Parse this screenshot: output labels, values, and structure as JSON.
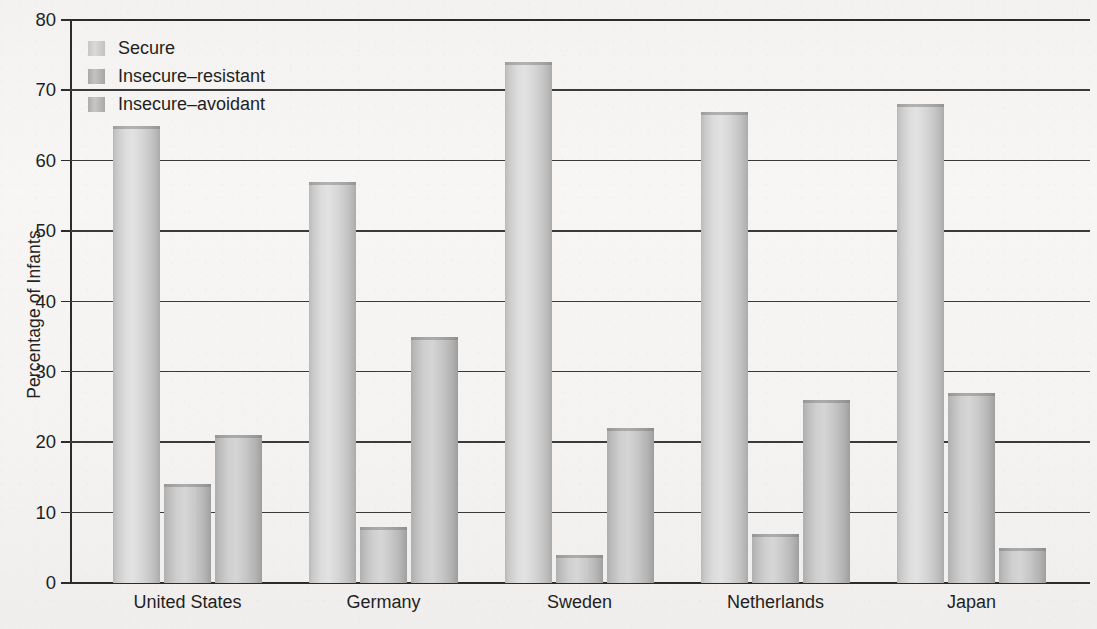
{
  "chart_data": {
    "type": "bar",
    "title": "",
    "xlabel": "",
    "ylabel": "Percentage of Infants",
    "ylim": [
      0,
      80
    ],
    "ytick_step": 10,
    "yticks": [
      "0",
      "10",
      "20",
      "30",
      "40",
      "50",
      "60",
      "70",
      "80"
    ],
    "grid": "horizontal",
    "legend_position": "top-left inside plot",
    "categories": [
      "United States",
      "Germany",
      "Sweden",
      "Netherlands",
      "Japan"
    ],
    "series": [
      {
        "name": "Secure",
        "values": [
          65,
          57,
          74,
          67,
          68
        ]
      },
      {
        "name": "Insecure–resistant",
        "values": [
          14,
          8,
          4,
          7,
          27
        ]
      },
      {
        "name": "Insecure–avoidant",
        "values": [
          21,
          35,
          22,
          26,
          5
        ]
      }
    ],
    "colors": {
      "secure": "#dcdcdc",
      "insecure_resistant": "#cfcfcf",
      "insecure_avoidant": "#cccccc",
      "axis": "#2c2c2c",
      "gridline": "#3a3a3a",
      "text": "#1f1f1f",
      "background": "#f4f3f1"
    }
  }
}
